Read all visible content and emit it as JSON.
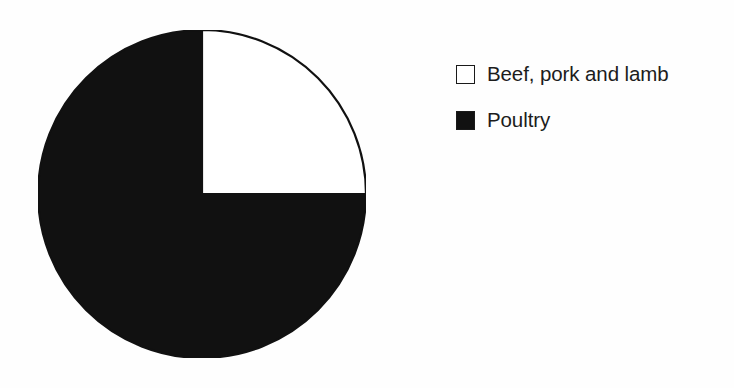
{
  "chart_data": {
    "type": "pie",
    "title": "",
    "subtitle": "",
    "xlabel": "",
    "ylabel": "",
    "grid": false,
    "legend_position": "right",
    "start_angle_deg": 0,
    "direction": "clockwise",
    "categories": [
      "Beef, pork and lamb",
      "Poultry"
    ],
    "values": [
      25,
      75
    ],
    "value_unit": "percent",
    "slices": [
      {
        "label": "Beef, pork and lamb",
        "value": 25,
        "percent": "25%",
        "color": "#ffffff",
        "edge_color": "#111111",
        "swatch": "hollow"
      },
      {
        "label": "Poultry",
        "value": 75,
        "percent": "75%",
        "color": "#111111",
        "edge_color": "#111111",
        "swatch": "filled"
      }
    ],
    "annotations": []
  },
  "figure": {
    "background_color": "#fefefe",
    "ink_color": "#111111"
  },
  "legend": {
    "items": [
      {
        "label": "Beef, pork and lamb",
        "swatch": "hollow",
        "color": "#ffffff"
      },
      {
        "label": "Poultry",
        "swatch": "filled",
        "color": "#111111"
      }
    ]
  }
}
